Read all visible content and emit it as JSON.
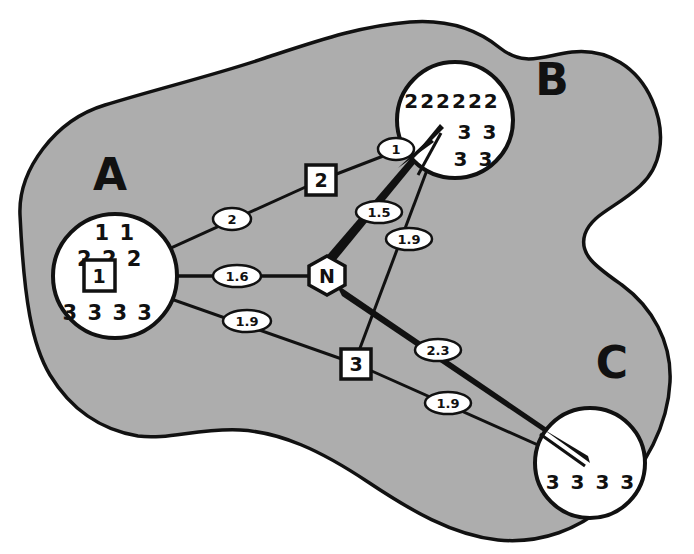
{
  "diagram": {
    "background_color": "#ffffff",
    "region_fill_color": "#adadad",
    "region_stroke_color": "#111111",
    "node_fill_color": "#ffffff",
    "node_stroke_color": "#111111",
    "edge_color": "#111111"
  },
  "regions": [
    {
      "id": "A",
      "label": "A",
      "x": 110,
      "y": 190
    },
    {
      "id": "B",
      "label": "B",
      "x": 552,
      "y": 95
    },
    {
      "id": "C",
      "label": "C",
      "x": 612,
      "y": 378
    }
  ],
  "nodes": [
    {
      "id": "A",
      "label": "A",
      "cx": 115,
      "cy": 276,
      "r": 62,
      "contents": [
        "1 1",
        "2 2 2",
        "3 3 3 3"
      ],
      "boxed_label": "1"
    },
    {
      "id": "B",
      "label": "B",
      "cx": 455,
      "cy": 120,
      "r": 58,
      "contents": [
        "222222",
        "3 3",
        "3 3"
      ],
      "boxed_label": ""
    },
    {
      "id": "C",
      "label": "C",
      "cx": 590,
      "cy": 463,
      "r": 55,
      "contents": [
        "3 3 3 3"
      ],
      "boxed_label": ""
    }
  ],
  "hub": {
    "id": "N",
    "label": "N",
    "cx": 327,
    "cy": 275,
    "shape": "hexagon"
  },
  "box_markers": [
    {
      "id": "box2",
      "label": "2",
      "x": 321,
      "y": 180
    },
    {
      "id": "box1",
      "label": "1",
      "x": 99,
      "y": 275
    },
    {
      "id": "box3",
      "label": "3",
      "x": 356,
      "y": 364
    }
  ],
  "edges": [
    {
      "id": "edge-a-b-thin",
      "from": "A",
      "to": "B",
      "weight": "2",
      "weight_x": 232,
      "weight_y": 219,
      "thickness": "thin",
      "via_box": "2"
    },
    {
      "id": "edge-a-n",
      "from": "A",
      "to": "N",
      "weight": "1.6",
      "weight_x": 237,
      "weight_y": 276,
      "thickness": "thin",
      "via_box": ""
    },
    {
      "id": "edge-a-c-thin",
      "from": "A",
      "to": "C",
      "weight": "1.9",
      "weight_x": 247,
      "weight_y": 321,
      "thickness": "thin",
      "via_box": "3"
    },
    {
      "id": "edge-ab-top",
      "from": "A",
      "to": "B",
      "weight": "1",
      "weight_x": 396,
      "weight_y": 149,
      "thickness": "thin",
      "via_box": ""
    },
    {
      "id": "edge-n-b-thick",
      "from": "N",
      "to": "B",
      "weight": "1.5",
      "weight_x": 379,
      "weight_y": 212,
      "thickness": "thick",
      "via_box": ""
    },
    {
      "id": "edge-box3-b",
      "from": "box3",
      "to": "B",
      "weight": "1.9",
      "weight_x": 409,
      "weight_y": 239,
      "thickness": "thin",
      "via_box": ""
    },
    {
      "id": "edge-n-c-thick",
      "from": "N",
      "to": "C",
      "weight": "2.3",
      "weight_x": 438,
      "weight_y": 350,
      "thickness": "thick",
      "via_box": ""
    },
    {
      "id": "edge-box3-c",
      "from": "box3",
      "to": "C",
      "weight": "1.9",
      "weight_x": 448,
      "weight_y": 403,
      "thickness": "thin",
      "via_box": ""
    }
  ]
}
